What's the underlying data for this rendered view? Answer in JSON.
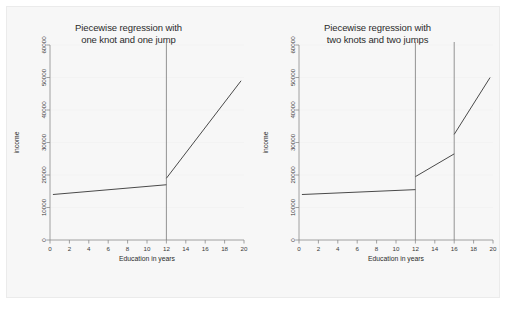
{
  "figure": {
    "background_color": "#f7f7f7",
    "panel_count": 2
  },
  "chart_data": [
    {
      "type": "line",
      "panel": "left",
      "title": "Piecewise regression with\none knot and one jump",
      "title_line1": "Piecewise regression with",
      "title_line2": "one knot and one jump",
      "xlabel": "Education in years",
      "ylabel": "income",
      "xlim": [
        0,
        20
      ],
      "ylim": [
        0,
        60000
      ],
      "xticks": [
        0,
        2,
        4,
        6,
        8,
        10,
        12,
        14,
        16,
        18,
        20
      ],
      "xticklabels": [
        "0",
        "2",
        "4",
        "6",
        "8",
        "10",
        "12",
        "14",
        "16",
        "18",
        "20"
      ],
      "yticks": [
        0,
        10000,
        20000,
        30000,
        40000,
        50000,
        60000
      ],
      "yticklabels": [
        "0",
        "10000",
        "20000",
        "30000",
        "40000",
        "50000",
        "60000"
      ],
      "grid": "horizontal-faint",
      "legend": null,
      "knots": [
        12
      ],
      "jumps": [
        {
          "x": 12,
          "from": 17000,
          "to": 19000
        }
      ],
      "segments": [
        {
          "name": "pre-knot",
          "points": [
            [
              0.3,
              14000
            ],
            [
              12,
              17000
            ]
          ]
        },
        {
          "name": "post-knot",
          "points": [
            [
              12,
              19000
            ],
            [
              19.7,
              49000
            ]
          ]
        }
      ],
      "line_color": "#4a4a4a",
      "knot_line_color": "#7a7a7a"
    },
    {
      "type": "line",
      "panel": "right",
      "title": "Piecewise regression with\ntwo knots and two jumps",
      "title_line1": "Piecewise regression with",
      "title_line2": "two knots and two jumps",
      "xlabel": "Education in years",
      "ylabel": "income",
      "xlim": [
        0,
        20
      ],
      "ylim": [
        0,
        60000
      ],
      "xticks": [
        0,
        2,
        4,
        6,
        8,
        10,
        12,
        14,
        16,
        18,
        20
      ],
      "xticklabels": [
        "0",
        "2",
        "4",
        "6",
        "8",
        "10",
        "12",
        "14",
        "16",
        "18",
        "20"
      ],
      "yticks": [
        0,
        10000,
        20000,
        30000,
        40000,
        50000,
        60000
      ],
      "yticklabels": [
        "0",
        "10000",
        "20000",
        "30000",
        "40000",
        "50000",
        "60000"
      ],
      "grid": "horizontal-faint",
      "legend": null,
      "knots": [
        12,
        16
      ],
      "jumps": [
        {
          "x": 12,
          "from": 15500,
          "to": 19500
        },
        {
          "x": 16,
          "from": 26500,
          "to": 32500
        }
      ],
      "segments": [
        {
          "name": "pre-knot-1",
          "points": [
            [
              0.3,
              14000
            ],
            [
              12,
              15500
            ]
          ]
        },
        {
          "name": "between-knots",
          "points": [
            [
              12,
              19500
            ],
            [
              16,
              26500
            ]
          ]
        },
        {
          "name": "post-knot-2",
          "points": [
            [
              16,
              32500
            ],
            [
              19.7,
              50000
            ]
          ]
        }
      ],
      "line_color": "#4a4a4a",
      "knot_line_color": "#7a7a7a"
    }
  ]
}
